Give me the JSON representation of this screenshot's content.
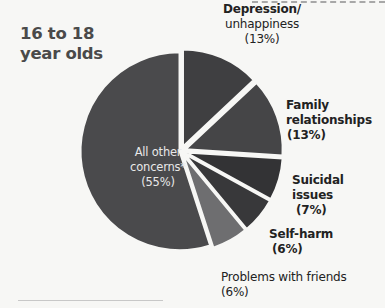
{
  "chart_data": {
    "type": "pie",
    "title": "16 to 18 year olds",
    "title_lines": [
      "16 to 18",
      "year olds"
    ],
    "slices": [
      {
        "label": "Depression/ unhappiness",
        "value": 13,
        "color": "#3f3f41"
      },
      {
        "label": "Family relationships",
        "value": 13,
        "color": "#454547"
      },
      {
        "label": "Suicidal issues",
        "value": 7,
        "color": "#333335"
      },
      {
        "label": "Self-harm",
        "value": 6,
        "color": "#38383a"
      },
      {
        "label": "Problems with friends",
        "value": 6,
        "color": "#6e6e70"
      },
      {
        "label": "All other concerns*",
        "value": 55,
        "color": "#4a4a4c"
      }
    ],
    "exploded": true
  },
  "labels": {
    "depression": {
      "line1": "Depression/",
      "line2": "unhappiness",
      "pct": "(13%)"
    },
    "family": {
      "line1": "Family",
      "line2": "relationships",
      "pct": "(13%)"
    },
    "suicidal": {
      "line1": "Suicidal",
      "line2": "issues",
      "pct": "(7%)"
    },
    "selfharm": {
      "line1": "Self-harm",
      "pct": "(6%)"
    },
    "friends": {
      "line1": "Problems with friends",
      "pct": "(6%)"
    },
    "other": {
      "line1": "All other",
      "line2": "concerns*",
      "pct": "(55%)"
    }
  }
}
